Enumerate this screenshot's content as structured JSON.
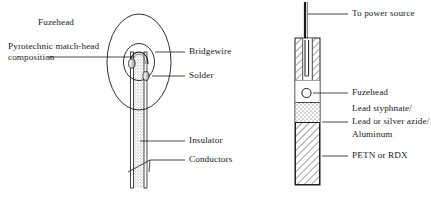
{
  "figure": {
    "background_color": "#ffffff",
    "line_color": "#1a1a1a",
    "text_color": "#1a1a1a"
  },
  "left_diagram": {
    "name": "fuzehead-detail",
    "labels": {
      "fuzehead": "Fuzehead",
      "pyrotechnic_line1": "Pyrotechnic match-head",
      "pyrotechnic_line2": "composition",
      "bridgewire": "Bridgewire",
      "solder": "Solder",
      "insulator": "Insulator",
      "conductors": "Conductors"
    }
  },
  "right_diagram": {
    "name": "detonator-assembly",
    "labels": {
      "power_source": "To power source",
      "fuzehead": "Fuzehead",
      "explosive_line1": "Lead styphnate/",
      "explosive_line2": "Lead or silver azide/",
      "explosive_line3": "Aluminum",
      "main_charge": "PETN or RDX"
    }
  }
}
